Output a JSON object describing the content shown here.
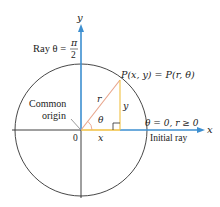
{
  "diagram": {
    "colors": {
      "axis": "#2b2b2b",
      "ray_blue": "#3d8fd0",
      "radius_red": "#e8a48a",
      "leg_yellow": "#f0c040",
      "circle": "#333333"
    },
    "labels": {
      "y_axis": "y",
      "x_axis": "x",
      "ray_pi2_prefix": "Ray θ =",
      "pi": "π",
      "two": "2",
      "point": "P(x, y) = P(r, θ)",
      "r": "r",
      "theta": "θ",
      "y_leg": "y",
      "x_leg": "x",
      "origin_zero": "0",
      "common": "Common",
      "origin": "origin",
      "initial_cond": "θ = 0, r ≥ 0",
      "initial_ray": "Initial ray"
    }
  }
}
